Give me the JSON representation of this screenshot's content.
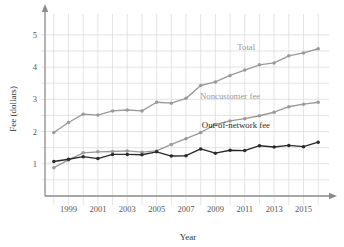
{
  "chart_data": {
    "type": "line",
    "title": "",
    "xlabel": "Year",
    "ylabel": "Fee (dollars)",
    "xlim": [
      1997.4,
      2016.6
    ],
    "ylim": [
      0,
      5.4
    ],
    "grid": true,
    "legend_position": "inline-annotations",
    "y_ticks": [
      1,
      2,
      3,
      4,
      5
    ],
    "y_tick_labels": [
      "1",
      "2",
      "3",
      "4",
      "5"
    ],
    "y_minor_step": 0.5,
    "x_ticks": [
      1999,
      2001,
      2003,
      2005,
      2007,
      2009,
      2011,
      2013,
      2015
    ],
    "x_tick_labels": [
      "1999",
      "2001",
      "2003",
      "2005",
      "2007",
      "2009",
      "2011",
      "2013",
      "2015"
    ],
    "x": [
      1998,
      1999,
      2000,
      2001,
      2002,
      2003,
      2004,
      2005,
      2006,
      2007,
      2008,
      2009,
      2010,
      2011,
      2012,
      2013,
      2014,
      2015,
      2016
    ],
    "series": [
      {
        "name": "Total",
        "color": "#9a9a9a",
        "label": "Total",
        "values": [
          1.97,
          2.28,
          2.54,
          2.51,
          2.64,
          2.67,
          2.64,
          2.91,
          2.88,
          3.03,
          3.43,
          3.54,
          3.74,
          3.91,
          4.07,
          4.13,
          4.35,
          4.44,
          4.57
        ]
      },
      {
        "name": "Noncustomer fee",
        "color": "#9a9a9a",
        "label": "Noncustomer fee",
        "values": [
          0.88,
          1.12,
          1.34,
          1.37,
          1.38,
          1.4,
          1.36,
          1.4,
          1.6,
          1.78,
          1.97,
          2.22,
          2.33,
          2.4,
          2.49,
          2.6,
          2.77,
          2.85,
          2.91
        ]
      },
      {
        "name": "Out-of-network fee",
        "color": "#2a2a2a",
        "label": "Out-of-network fee",
        "values": [
          1.07,
          1.14,
          1.22,
          1.16,
          1.29,
          1.29,
          1.28,
          1.37,
          1.24,
          1.25,
          1.46,
          1.33,
          1.42,
          1.41,
          1.56,
          1.52,
          1.57,
          1.53,
          1.67
        ]
      }
    ],
    "annotations": [
      {
        "text": "Total",
        "x": 2011.1,
        "y": 4.52,
        "color": "#9a9a9a"
      },
      {
        "text": "Noncustomer fee",
        "x": 2010.0,
        "y": 3.0,
        "color": "#9a9a9a"
      },
      {
        "text": "Out-of-network fee",
        "x": 2010.4,
        "y": 2.11,
        "color": "#2a2a2a"
      }
    ],
    "colors": {
      "total": "#9a9a9a",
      "noncustomer": "#9a9a9a",
      "out_of_network": "#2a2a2a",
      "grid": "#d8d8d8",
      "axis": "#8a8a8a",
      "tick_text": "#555555"
    }
  }
}
